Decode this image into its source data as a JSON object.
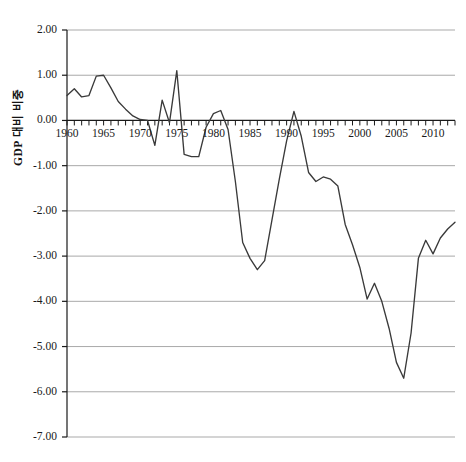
{
  "figure": {
    "top_cropped_text": "",
    "background_color": "#ffffff",
    "line_color": "#3a3a3a",
    "grid_color": "#9a9a9a",
    "axis_color": "#1a1a1a"
  },
  "chart_data": {
    "type": "line",
    "title": "",
    "xlabel": "",
    "ylabel": "GDP 대비 비중",
    "xlim": [
      1960,
      2013
    ],
    "ylim": [
      -7.0,
      2.0
    ],
    "grid": true,
    "legend": null,
    "y_ticks": [
      2.0,
      1.0,
      0.0,
      -1.0,
      -2.0,
      -3.0,
      -4.0,
      -5.0,
      -6.0,
      -7.0
    ],
    "y_tick_labels": [
      "2.00",
      "1.00",
      "0.00",
      "-1.00",
      "-2.00",
      "-3.00",
      "-4.00",
      "-5.00",
      "-6.00",
      "-7.00"
    ],
    "x_ticks": [
      1960,
      1965,
      1970,
      1975,
      1980,
      1985,
      1990,
      1995,
      2000,
      2005,
      2010
    ],
    "x_tick_labels": [
      "1960",
      "1965",
      "1970",
      "1975",
      "1980",
      "1985",
      "1990",
      "1995",
      "2000",
      "2005",
      "2010"
    ],
    "x_minor_tick_interval": 1,
    "series": [
      {
        "name": "GDP 대비 비중",
        "x": [
          1960,
          1961,
          1962,
          1963,
          1964,
          1965,
          1966,
          1967,
          1968,
          1969,
          1970,
          1971,
          1972,
          1973,
          1974,
          1975,
          1976,
          1977,
          1978,
          1979,
          1980,
          1981,
          1982,
          1983,
          1984,
          1985,
          1986,
          1987,
          1988,
          1989,
          1990,
          1991,
          1992,
          1993,
          1994,
          1995,
          1996,
          1997,
          1998,
          1999,
          2000,
          2001,
          2002,
          2003,
          2004,
          2005,
          2006,
          2007,
          2008,
          2009,
          2010,
          2011,
          2012,
          2013
        ],
        "y": [
          0.55,
          0.7,
          0.52,
          0.55,
          0.98,
          1.0,
          0.72,
          0.42,
          0.25,
          0.1,
          0.02,
          0.0,
          -0.55,
          0.45,
          -0.05,
          1.1,
          -0.75,
          -0.8,
          -0.8,
          -0.15,
          0.15,
          0.22,
          -0.2,
          -1.35,
          -2.7,
          -3.05,
          -3.3,
          -3.1,
          -2.2,
          -1.3,
          -0.45,
          0.2,
          -0.35,
          -1.15,
          -1.35,
          -1.25,
          -1.3,
          -1.45,
          -2.3,
          -2.75,
          -3.25,
          -3.95,
          -3.6,
          -4.0,
          -4.6,
          -5.35,
          -5.7,
          -4.7,
          -3.05,
          -2.65,
          -2.95,
          -2.6,
          -2.4,
          -2.25
        ]
      }
    ]
  },
  "axes": {
    "y_title": "GDP 대비 비중"
  }
}
